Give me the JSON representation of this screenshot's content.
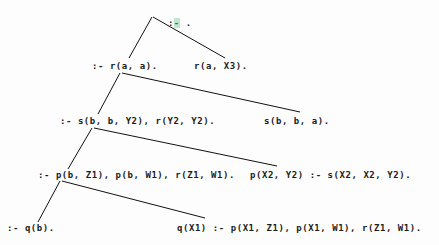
{
  "diagram": {
    "type": "sld-resolution-tree",
    "title": "",
    "background_color": "#fdfdfd",
    "text_color": "#1b1b1b",
    "edge_color": "#111111",
    "highlight_color": "#bfe6cf",
    "nodes": [
      {
        "id": "n0",
        "label": ":- .",
        "prefix": ":",
        "highlight": "-",
        "suffix": " .",
        "x": 144,
        "y": 7,
        "row": 0,
        "kind": "goal-root"
      },
      {
        "id": "n1",
        "label": ":- r(a, a).",
        "x": 92,
        "y": 61,
        "row": 1,
        "kind": "goal"
      },
      {
        "id": "n2",
        "label": "r(a, X3).",
        "x": 194,
        "y": 61,
        "row": 1,
        "kind": "clause"
      },
      {
        "id": "n3",
        "label": ":- s(b, b, Y2), r(Y2, Y2).",
        "x": 60,
        "y": 116,
        "row": 2,
        "kind": "goal"
      },
      {
        "id": "n4",
        "label": "s(b, b, a).",
        "x": 264,
        "y": 116,
        "row": 2,
        "kind": "clause"
      },
      {
        "id": "n5",
        "label": ":- p(b, Z1), p(b, W1), r(Z1, W1).",
        "x": 38,
        "y": 170,
        "row": 3,
        "kind": "goal"
      },
      {
        "id": "n6",
        "label": "p(X2, Y2) :- s(X2, X2, Y2).",
        "x": 250,
        "y": 170,
        "row": 3,
        "kind": "clause"
      },
      {
        "id": "n7",
        "label": ":- q(b).",
        "x": 7,
        "y": 223,
        "row": 4,
        "kind": "goal"
      },
      {
        "id": "n8",
        "label": "q(X1) :- p(X1, Z1), p(X1, W1), r(Z1, W1).",
        "x": 177,
        "y": 223,
        "row": 4,
        "kind": "clause"
      }
    ],
    "edges": [
      {
        "id": "e0",
        "from": "n0",
        "to": "n1",
        "x1": 152,
        "y1": 17,
        "x2": 129,
        "y2": 58,
        "direction": "down-left"
      },
      {
        "id": "e1",
        "from": "n0",
        "to": "n2",
        "x1": 153,
        "y1": 17,
        "x2": 225,
        "y2": 58,
        "direction": "down-right"
      },
      {
        "id": "e2",
        "from": "n1",
        "to": "n3",
        "x1": 120,
        "y1": 73,
        "x2": 98,
        "y2": 114,
        "direction": "down-left"
      },
      {
        "id": "e3",
        "from": "n1",
        "to": "n4",
        "x1": 122,
        "y1": 73,
        "x2": 300,
        "y2": 112,
        "direction": "down-right"
      },
      {
        "id": "e4",
        "from": "n3",
        "to": "n5",
        "x1": 92,
        "y1": 128,
        "x2": 68,
        "y2": 169,
        "direction": "down-left"
      },
      {
        "id": "e5",
        "from": "n3",
        "to": "n6",
        "x1": 94,
        "y1": 128,
        "x2": 277,
        "y2": 166,
        "direction": "down-right"
      },
      {
        "id": "e6",
        "from": "n5",
        "to": "n7",
        "x1": 60,
        "y1": 181,
        "x2": 38,
        "y2": 222,
        "direction": "down-left"
      },
      {
        "id": "e7",
        "from": "n5",
        "to": "n8",
        "x1": 62,
        "y1": 181,
        "x2": 205,
        "y2": 218,
        "direction": "down-right"
      }
    ]
  }
}
